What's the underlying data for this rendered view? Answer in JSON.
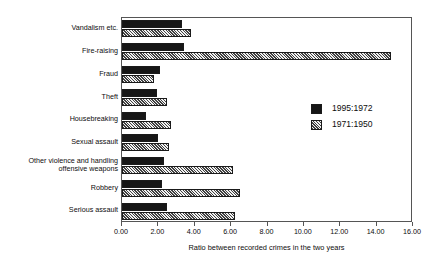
{
  "chart_data": {
    "type": "bar",
    "orientation": "horizontal",
    "title": "",
    "xlabel": "Ratio between recorded crimes in the two years",
    "ylabel": "",
    "xlim": [
      0.0,
      16.0
    ],
    "xticks": [
      "0.00",
      "2.00",
      "4.00",
      "6.00",
      "8.00",
      "10.00",
      "12.00",
      "14.00",
      "16.00"
    ],
    "xtick_values": [
      0,
      2,
      4,
      6,
      8,
      10,
      12,
      14,
      16
    ],
    "grid": false,
    "legend_position": "center-right-inside",
    "categories": [
      "Vandalism etc.",
      "Fire-raising",
      "Fraud",
      "Theft",
      "Housebreaking",
      "Sexual assault",
      "Other violence and handling\noffensive weapons",
      "Robbery",
      "Serious assault"
    ],
    "series": [
      {
        "name": "1995:1972",
        "fill": "solid-black",
        "values": [
          3.3,
          3.4,
          2.1,
          1.95,
          1.3,
          2.0,
          2.3,
          2.2,
          2.45
        ]
      },
      {
        "name": "1971:1950",
        "fill": "hatched-grey",
        "values": [
          3.8,
          14.8,
          1.75,
          2.5,
          2.7,
          2.6,
          6.1,
          6.5,
          6.2
        ]
      }
    ]
  },
  "colors": {
    "series_1995_1972": "#161616",
    "series_1971_1950": "#a9a9a9",
    "axis": "#555555",
    "background": "#ffffff",
    "text": "#0d0d0d"
  },
  "legend": {
    "entries": [
      {
        "label": "1995:1972"
      },
      {
        "label": "1971:1950"
      }
    ]
  }
}
